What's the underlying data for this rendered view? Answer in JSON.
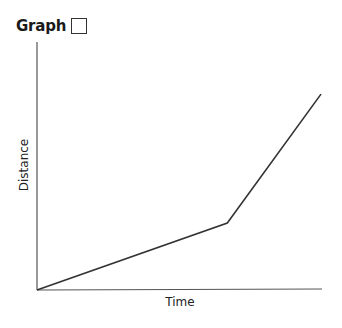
{
  "header": {
    "title": "Graph",
    "answer_box_icon": "empty-checkbox-square"
  },
  "chart_data": {
    "type": "line",
    "title": "Graph",
    "xlabel": "Time",
    "ylabel": "Distance",
    "grid": false,
    "legend": null,
    "x_ticks": [],
    "y_ticks": [],
    "series": [
      {
        "name": "Distance vs Time",
        "color": "#333333",
        "points": [
          {
            "x": 0,
            "y": 0
          },
          {
            "x": 0.67,
            "y": 0.27
          },
          {
            "x": 1.0,
            "y": 0.79
          }
        ]
      }
    ],
    "xlim": [
      0,
      1
    ],
    "ylim": [
      0,
      1
    ]
  }
}
